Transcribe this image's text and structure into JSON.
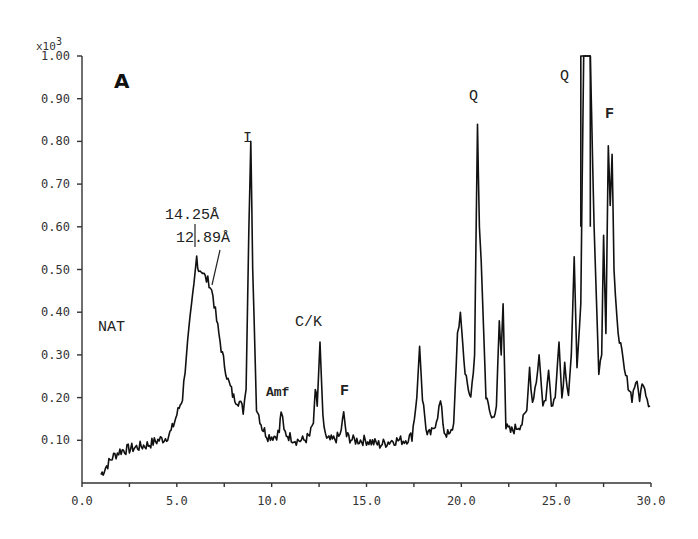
{
  "chart_data": {
    "type": "line",
    "title": "",
    "panel_label": "A",
    "xlabel": "",
    "ylabel": "",
    "y_multiplier_label": "x10",
    "y_multiplier_exponent": "3",
    "xlim": [
      0.0,
      30.0
    ],
    "ylim": [
      0.0,
      1.0
    ],
    "grid": false,
    "legend": null,
    "x_ticks": [
      "0.0",
      "5.0",
      "10.0",
      "15.0",
      "20.0",
      "25.0",
      "30.0"
    ],
    "x_tick_values": [
      0,
      5,
      10,
      15,
      20,
      25,
      30
    ],
    "y_ticks": [
      "0.10",
      "0.20",
      "0.30",
      "0.40",
      "0.50",
      "0.60",
      "0.70",
      "0.80",
      "0.90",
      "1.00"
    ],
    "y_tick_values": [
      0.1,
      0.2,
      0.3,
      0.4,
      0.5,
      0.6,
      0.7,
      0.8,
      0.9,
      1.0
    ],
    "series": [
      {
        "name": "NAT",
        "x": [
          1.0,
          1.3,
          1.6,
          2.0,
          2.5,
          3.0,
          3.5,
          4.0,
          4.4,
          4.7,
          5.0,
          5.3,
          5.5,
          5.7,
          5.9,
          6.05,
          6.15,
          6.3,
          6.5,
          6.7,
          6.9,
          7.1,
          7.4,
          7.7,
          8.0,
          8.3,
          8.5,
          8.65,
          8.8,
          8.9,
          9.0,
          9.2,
          9.5,
          9.8,
          10.2,
          10.4,
          10.5,
          10.65,
          10.9,
          11.3,
          11.7,
          12.0,
          12.2,
          12.3,
          12.4,
          12.55,
          12.7,
          12.9,
          13.2,
          13.6,
          13.8,
          13.95,
          14.3,
          15.0,
          15.7,
          16.4,
          17.0,
          17.4,
          17.65,
          17.8,
          17.95,
          18.2,
          18.5,
          18.75,
          18.9,
          19.1,
          19.4,
          19.6,
          19.8,
          19.95,
          20.2,
          20.5,
          20.7,
          20.85,
          20.95,
          21.05,
          21.3,
          21.6,
          21.85,
          22.0,
          22.1,
          22.2,
          22.35,
          22.6,
          22.9,
          23.2,
          23.45,
          23.6,
          23.75,
          23.95,
          24.1,
          24.3,
          24.45,
          24.6,
          24.75,
          24.95,
          25.15,
          25.3,
          25.45,
          25.65,
          25.8,
          25.95,
          26.1,
          26.3,
          26.45,
          26.8,
          27.0,
          27.25,
          27.4,
          27.5,
          27.62,
          27.75,
          27.85,
          27.95,
          28.05,
          28.2,
          28.4,
          28.6,
          28.8,
          29.0,
          29.2,
          29.4,
          29.6,
          29.8,
          29.95
        ],
        "y": [
          0.02,
          0.04,
          0.06,
          0.075,
          0.08,
          0.085,
          0.09,
          0.1,
          0.105,
          0.12,
          0.16,
          0.2,
          0.3,
          0.38,
          0.46,
          0.53,
          0.5,
          0.5,
          0.48,
          0.47,
          0.44,
          0.38,
          0.3,
          0.24,
          0.2,
          0.19,
          0.17,
          0.22,
          0.6,
          0.8,
          0.5,
          0.18,
          0.13,
          0.11,
          0.11,
          0.12,
          0.17,
          0.12,
          0.11,
          0.1,
          0.1,
          0.11,
          0.14,
          0.22,
          0.18,
          0.33,
          0.15,
          0.1,
          0.1,
          0.11,
          0.16,
          0.11,
          0.1,
          0.1,
          0.09,
          0.1,
          0.1,
          0.11,
          0.2,
          0.32,
          0.2,
          0.11,
          0.12,
          0.16,
          0.19,
          0.12,
          0.11,
          0.14,
          0.35,
          0.4,
          0.25,
          0.2,
          0.3,
          0.84,
          0.6,
          0.52,
          0.2,
          0.15,
          0.18,
          0.38,
          0.3,
          0.42,
          0.13,
          0.12,
          0.13,
          0.14,
          0.17,
          0.27,
          0.19,
          0.24,
          0.3,
          0.18,
          0.2,
          0.26,
          0.19,
          0.2,
          0.33,
          0.2,
          0.28,
          0.21,
          0.3,
          0.53,
          0.27,
          0.42,
          1.0,
          1.0,
          0.6,
          0.25,
          0.3,
          0.58,
          0.35,
          0.79,
          0.65,
          0.77,
          0.5,
          0.38,
          0.32,
          0.26,
          0.23,
          0.2,
          0.24,
          0.2,
          0.24,
          0.2,
          0.18
        ]
      }
    ],
    "annotations": [
      {
        "text": "A",
        "x": 2.0,
        "y": 0.92,
        "role": "panel-label"
      },
      {
        "text": "NAT",
        "x": 1.0,
        "y": 0.38,
        "role": "sample-label"
      },
      {
        "text": "14.25Å",
        "x": 4.5,
        "y": 0.615,
        "role": "d-spacing"
      },
      {
        "text": "12.89Å",
        "x": 5.2,
        "y": 0.57,
        "role": "d-spacing"
      },
      {
        "text": "I",
        "x": 8.85,
        "y": 0.87,
        "role": "peak-label"
      },
      {
        "text": "Amf",
        "x": 10.5,
        "y": 0.21,
        "role": "peak-label"
      },
      {
        "text": "C/K",
        "x": 12.5,
        "y": 0.37,
        "role": "peak-label"
      },
      {
        "text": "F",
        "x": 13.8,
        "y": 0.21,
        "role": "peak-label"
      },
      {
        "text": "Q",
        "x": 20.8,
        "y": 0.91,
        "role": "peak-label"
      },
      {
        "text": "Q",
        "x": 25.8,
        "y": 0.97,
        "role": "peak-label"
      },
      {
        "text": "F",
        "x": 27.9,
        "y": 0.85,
        "role": "peak-label"
      }
    ]
  },
  "labels": {
    "panel": "A",
    "multiplier_base": "x10",
    "multiplier_exp": "3",
    "sample": "NAT",
    "d1": "14.25Å",
    "d2": "12.89Å",
    "peak_I": "I",
    "peak_Amf": "Amf",
    "peak_CK": "C/K",
    "peak_F1": "F",
    "peak_Q1": "Q",
    "peak_Q2": "Q",
    "peak_F2": "F"
  },
  "style": {
    "trace_color": "#111111",
    "axis_color": "#333333",
    "background": "#ffffff"
  }
}
